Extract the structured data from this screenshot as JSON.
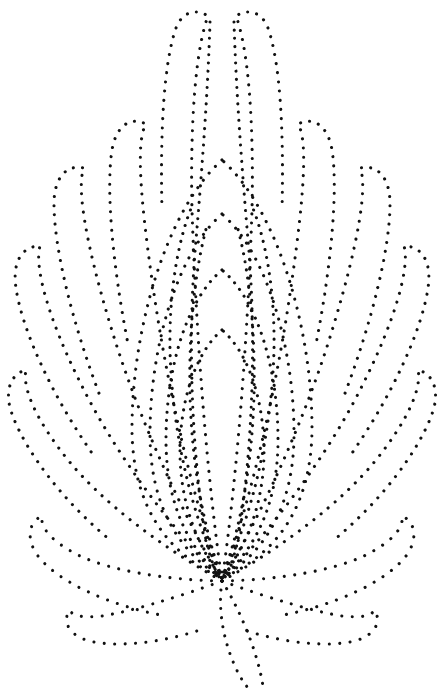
{
  "artwork": {
    "title": "Dotted floral motif",
    "subject": "lotus-flower-outline",
    "style": "pin-prick dotted stipple line art",
    "width": 438,
    "height": 695,
    "background_color": "#ffffff",
    "dot_color": "#111111",
    "dot_diameter_px": 3,
    "dot_spacing_px": 9,
    "base_point": {
      "x": 222,
      "y": 581
    },
    "apex_point": {
      "x": 222,
      "y": 8
    },
    "symmetry": "bilateral-vertical-axis-x222"
  },
  "paths": {
    "center_petal_inner": "M222 330 C 196 352 180 400 180 452 C 180 500 196 545 222 578 C 248 545 264 500 264 452 C 264 400 248 352 222 330 Z",
    "center_petal_mid": "M222 270 C 186 300 166 370 166 440 C 166 500 186 546 222 578 C 258 546 278 500 278 440 C 278 370 258 300 222 270 Z",
    "center_petal_outer": "M222 214 C 176 254 150 350 150 434 C 150 502 176 550 222 578 C 268 550 294 502 294 434 C 294 350 268 254 222 214 Z",
    "center_petal_outer2": "M222 160 C 166 210 132 330 132 428 C 132 504 166 554 222 578 C 278 554 312 504 312 428 C 312 330 278 210 222 160 Z",
    "axis_left": "M210 22 C 208 90 202 170 196 240 C 188 330 190 440 206 540 C 212 566 218 576 222 581",
    "axis_right": "M234 22 C 236 90 242 170 248 240 C 256 330 254 440 238 540 C 232 566 226 576 222 581",
    "top_petal_left": "M222 581 C 206 470 196 330 192 210 C 190 120 196 48 208 16 C 196 8 182 12 176 28 C 164 62 160 130 162 210",
    "top_petal_right": "M222 581 C 238 470 248 330 252 210 C 254 120 248 48 236 16 C 248 8 262 12 268 28 C 280 62 284 130 282 210",
    "petal_L2": "M222 581 C 190 490 166 380 152 280 C 140 196 136 140 146 124 C 130 116 116 126 112 150 C 106 188 112 262 128 344",
    "petal_R2": "M222 581 C 254 490 278 380 292 280 C 304 196 308 140 298 124 C 314 116 328 126 332 150 C 338 188 332 262 316 344",
    "petal_L3": "M222 581 C 178 506 136 412 110 324 C 86 244 76 186 84 168 C 66 164 54 178 54 204 C 54 248 72 322 100 396",
    "petal_R3": "M222 581 C 266 506 308 412 334 324 C 358 244 368 186 360 168 C 378 164 390 178 390 204 C 390 248 372 322 344 396",
    "petal_L4": "M222 581 C 168 524 114 452 80 382 C 48 318 34 266 40 246 C 22 246 12 262 16 288 C 22 330 52 396 94 456",
    "petal_R4": "M222 581 C 276 524 330 452 364 382 C 396 318 410 266 404 246 C 422 246 432 262 428 288 C 422 330 392 396 350 456",
    "petal_L5": "M222 581 C 160 546 102 502 68 460 C 36 420 22 388 26 370 C 10 374 4 392 12 414 C 26 452 62 500 110 540",
    "petal_R5": "M222 581 C 284 546 342 502 376 460 C 408 420 422 388 418 370 C 434 374 440 392 432 414 C 418 452 382 500 334 540",
    "petal_L6": "M222 581 C 164 580 110 570 80 556 C 52 542 40 528 42 516 C 28 522 26 540 38 556 C 58 582 110 606 166 616",
    "petal_R6": "M222 581 C 280 580 334 570 364 556 C 392 542 404 528 402 516 C 416 522 418 540 406 556 C 386 582 334 606 278 616",
    "petal_L7": "M222 581 C 176 598 128 612 102 616 C 82 618 72 616 70 610 C 62 620 68 634 86 640 C 112 648 160 644 206 628",
    "petal_R7": "M222 581 C 268 598 316 612 342 616 C 362 618 372 616 374 610 C 382 620 376 634 358 640 C 332 648 284 644 238 628",
    "stem_left": "M222 581 C 218 606 222 636 234 664 C 240 678 246 686 250 690",
    "stem_right": "M222 581 C 234 600 246 626 254 650 C 259 666 262 678 263 687",
    "inner_fan_L1": "M222 578 C 200 520 188 440 190 360 C 191 306 198 256 208 222",
    "inner_fan_R1": "M222 578 C 244 520 256 440 254 360 C 253 306 246 256 236 222",
    "inner_fan_L2": "M222 578 C 192 518 172 432 170 350 C 169 292 178 240 192 206",
    "inner_fan_R2": "M222 578 C 252 518 272 432 274 350 C 275 292 266 240 252 206"
  },
  "path_render_order": [
    "top_petal_left",
    "top_petal_right",
    "petal_L2",
    "petal_R2",
    "petal_L3",
    "petal_R3",
    "petal_L4",
    "petal_R4",
    "petal_L5",
    "petal_R5",
    "petal_L6",
    "petal_R6",
    "petal_L7",
    "petal_R7",
    "center_petal_outer2",
    "center_petal_outer",
    "center_petal_mid",
    "center_petal_inner",
    "inner_fan_L1",
    "inner_fan_R1",
    "inner_fan_L2",
    "inner_fan_R2",
    "axis_left",
    "axis_right",
    "stem_left",
    "stem_right"
  ]
}
